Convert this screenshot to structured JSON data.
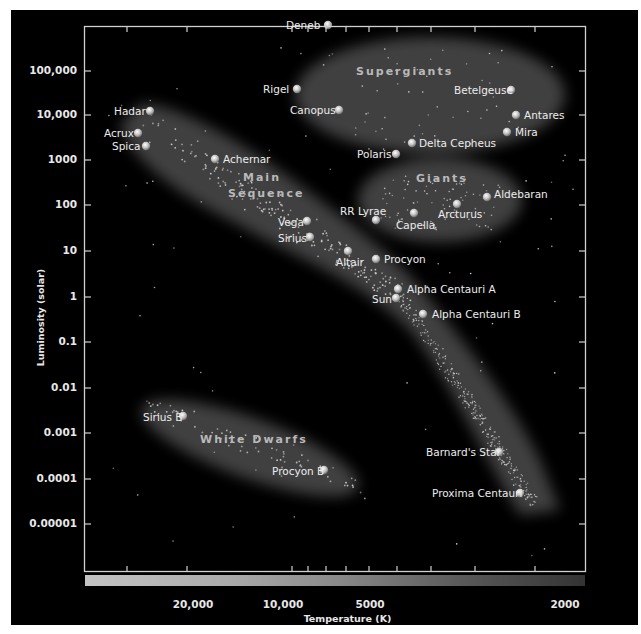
{
  "chart_data": {
    "type": "scatter",
    "xlabel": "Temperature (K)",
    "ylabel": "Luminosity (solar)",
    "x_scale": "log, reversed (hot on left)",
    "y_scale": "log",
    "x_ticks": [
      "20,000",
      "10,000",
      "5000",
      "2000"
    ],
    "y_ticks": [
      "100,000",
      "10,000",
      "1000",
      "100",
      "10",
      "1",
      "0.1",
      "0.01",
      "0.001",
      "0.0001",
      "0.00001"
    ],
    "regions": [
      "Supergiants",
      "Giants",
      "Main Sequence",
      "White Dwarfs"
    ],
    "stars": [
      {
        "name": "Deneb",
        "temperature": 8500,
        "luminosity": 200000
      },
      {
        "name": "Rigel",
        "temperature": 11000,
        "luminosity": 40000
      },
      {
        "name": "Canopus",
        "temperature": 7500,
        "luminosity": 13000
      },
      {
        "name": "Betelgeuse",
        "temperature": 2600,
        "luminosity": 40000
      },
      {
        "name": "Antares",
        "temperature": 2500,
        "luminosity": 10000
      },
      {
        "name": "Mira",
        "temperature": 2600,
        "luminosity": 4500
      },
      {
        "name": "Delta Cepheus",
        "temperature": 5500,
        "luminosity": 2500
      },
      {
        "name": "Polaris",
        "temperature": 6000,
        "luminosity": 1500
      },
      {
        "name": "Hadar",
        "temperature": 25000,
        "luminosity": 12000
      },
      {
        "name": "Acrux",
        "temperature": 27000,
        "luminosity": 4000
      },
      {
        "name": "Spica",
        "temperature": 26000,
        "luminosity": 2200
      },
      {
        "name": "Achernar",
        "temperature": 15000,
        "luminosity": 1000
      },
      {
        "name": "Aldebaran",
        "temperature": 2800,
        "luminosity": 150
      },
      {
        "name": "Arcturus",
        "temperature": 4000,
        "luminosity": 110
      },
      {
        "name": "Capella",
        "temperature": 5000,
        "luminosity": 70
      },
      {
        "name": "RR Lyrae",
        "temperature": 6800,
        "luminosity": 50
      },
      {
        "name": "Vega",
        "temperature": 9500,
        "luminosity": 50
      },
      {
        "name": "Sirius",
        "temperature": 9700,
        "luminosity": 22
      },
      {
        "name": "Altair",
        "temperature": 7800,
        "luminosity": 11
      },
      {
        "name": "Procyon",
        "temperature": 6700,
        "luminosity": 7
      },
      {
        "name": "Alpha Centauri A",
        "temperature": 5900,
        "luminosity": 1.5
      },
      {
        "name": "Sun",
        "temperature": 5800,
        "luminosity": 1
      },
      {
        "name": "Alpha Centauri B",
        "temperature": 4800,
        "luminosity": 0.45
      },
      {
        "name": "Sirius B",
        "temperature": 21000,
        "luminosity": 0.0025
      },
      {
        "name": "Procyon B",
        "temperature": 8800,
        "luminosity": 0.00016
      },
      {
        "name": "Barnard's Star",
        "temperature": 3100,
        "luminosity": 0.0004
      },
      {
        "name": "Proxima Centauri",
        "temperature": 2700,
        "luminosity": 5e-05
      }
    ],
    "grid": false,
    "legend": "none"
  },
  "axes": {
    "y_title": "Luminosity (solar)",
    "x_title": "Temperature (K)",
    "y_ticks": [
      {
        "label": "100,000",
        "y": 71
      },
      {
        "label": "10,000",
        "y": 115
      },
      {
        "label": "1000",
        "y": 160
      },
      {
        "label": "100",
        "y": 205
      },
      {
        "label": "10",
        "y": 251
      },
      {
        "label": "1",
        "y": 297
      },
      {
        "label": "0.1",
        "y": 342
      },
      {
        "label": "0.01",
        "y": 388
      },
      {
        "label": "0.001",
        "y": 433
      },
      {
        "label": "0.0001",
        "y": 479
      },
      {
        "label": "0.00001",
        "y": 524
      }
    ],
    "x_ticks": [
      {
        "label": "20,000",
        "x": 193
      },
      {
        "label": "10,000",
        "x": 283
      },
      {
        "label": "5000",
        "x": 370
      },
      {
        "label": "2000",
        "x": 565
      }
    ]
  },
  "regions": {
    "supergiants": "Supergiants",
    "giants": "Giants",
    "main_sequence_1": "Main",
    "main_sequence_2": "Sequence",
    "white_dwarfs": "White Dwarfs"
  },
  "stars": [
    {
      "name": "Deneb",
      "x": 328,
      "y": 25,
      "lx": 286,
      "ly": 19
    },
    {
      "name": "Rigel",
      "x": 297,
      "y": 89,
      "lx": 263,
      "ly": 83
    },
    {
      "name": "Canopus",
      "x": 339,
      "y": 110,
      "lx": 290,
      "ly": 104
    },
    {
      "name": "Betelgeuse",
      "x": 511,
      "y": 90,
      "lx": 454,
      "ly": 84
    },
    {
      "name": "Antares",
      "x": 516,
      "y": 115,
      "lx": 524,
      "ly": 109
    },
    {
      "name": "Mira",
      "x": 507,
      "y": 132,
      "lx": 515,
      "ly": 126
    },
    {
      "name": "Delta Cepheus",
      "x": 412,
      "y": 143,
      "lx": 419,
      "ly": 137
    },
    {
      "name": "Polaris",
      "x": 396,
      "y": 154,
      "lx": 357,
      "ly": 148
    },
    {
      "name": "Hadar",
      "x": 150,
      "y": 111,
      "lx": 114,
      "ly": 105
    },
    {
      "name": "Acrux",
      "x": 138,
      "y": 133,
      "lx": 104,
      "ly": 127
    },
    {
      "name": "Spica",
      "x": 146,
      "y": 146,
      "lx": 112,
      "ly": 140
    },
    {
      "name": "Achernar",
      "x": 215,
      "y": 159,
      "lx": 223,
      "ly": 153
    },
    {
      "name": "Aldebaran",
      "x": 487,
      "y": 197,
      "lx": 494,
      "ly": 188
    },
    {
      "name": "Arcturus",
      "x": 457,
      "y": 204,
      "lx": 438,
      "ly": 208
    },
    {
      "name": "Capella",
      "x": 414,
      "y": 213,
      "lx": 396,
      "ly": 219
    },
    {
      "name": "RR Lyrae",
      "x": 376,
      "y": 220,
      "lx": 340,
      "ly": 205
    },
    {
      "name": "Vega",
      "x": 307,
      "y": 221,
      "lx": 278,
      "ly": 216
    },
    {
      "name": "Sirius",
      "x": 310,
      "y": 237,
      "lx": 278,
      "ly": 232
    },
    {
      "name": "Altair",
      "x": 348,
      "y": 251,
      "lx": 336,
      "ly": 256
    },
    {
      "name": "Procyon",
      "x": 376,
      "y": 259,
      "lx": 384,
      "ly": 253
    },
    {
      "name": "Alpha Centauri A",
      "x": 398,
      "y": 289,
      "lx": 407,
      "ly": 283
    },
    {
      "name": "Sun",
      "x": 396,
      "y": 298,
      "lx": 372,
      "ly": 293
    },
    {
      "name": "Alpha Centauri B",
      "x": 423,
      "y": 314,
      "lx": 432,
      "ly": 308
    },
    {
      "name": "Sirius B",
      "x": 183,
      "y": 416,
      "lx": 143,
      "ly": 411
    },
    {
      "name": "Procyon B",
      "x": 324,
      "y": 470,
      "lx": 272,
      "ly": 465
    },
    {
      "name": "Barnard's Star",
      "x": 499,
      "y": 452,
      "lx": 426,
      "ly": 446
    },
    {
      "name": "Proxima Centauri",
      "x": 520,
      "y": 493,
      "lx": 432,
      "ly": 487
    }
  ]
}
